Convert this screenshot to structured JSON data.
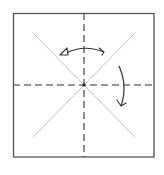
{
  "diagram": {
    "type": "origami-crease-pattern",
    "colors": {
      "background": "#ffffff",
      "paper_edge": "#555555",
      "valley_fold": "#333333",
      "crease": "#b5b5b5",
      "arrow": "#333333"
    },
    "paper": {
      "x": 13,
      "y": 13,
      "width": 141,
      "height": 144
    },
    "center": {
      "x": 84,
      "y": 85
    },
    "creases": [
      {
        "kind": "diagonal",
        "from": [
          33,
          33
        ],
        "to": [
          135,
          137
        ]
      },
      {
        "kind": "diagonal",
        "from": [
          135,
          33
        ],
        "to": [
          33,
          137
        ]
      }
    ],
    "valley_folds": [
      {
        "orientation": "vertical",
        "from": [
          84,
          13
        ],
        "to": [
          84,
          157
        ]
      },
      {
        "orientation": "horizontal",
        "from": [
          13,
          85
        ],
        "to": [
          154,
          85
        ]
      }
    ],
    "arrows": [
      {
        "name": "fold-and-unfold-arrow",
        "description": "curved arrow across top, hollow head left, barb right"
      },
      {
        "name": "fold-down-arrow",
        "description": "curved arrow on right pointing downward"
      }
    ]
  }
}
